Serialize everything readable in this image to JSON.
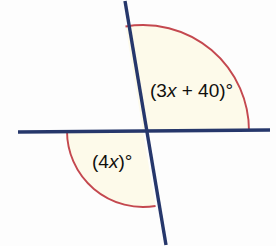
{
  "figure": {
    "kind": "geometry-diagram",
    "background_color": "#fdfdfd",
    "width": 276,
    "height": 246
  },
  "colors": {
    "line_navy": "#26376b",
    "arc_crimson": "#c4484f",
    "sector_fill": "#fdfaea",
    "text": "#100f0d"
  },
  "lines": [
    {
      "name": "horizontal-line",
      "x1": 18,
      "y1": 132,
      "x2": 270,
      "y2": 130,
      "stroke_width": 3.4
    },
    {
      "name": "transversal-line",
      "x1": 125,
      "y1": 1,
      "x2": 166,
      "y2": 245,
      "stroke_width": 3.4
    }
  ],
  "intersection": {
    "x": 143,
    "y": 131
  },
  "angles": [
    {
      "id": "upper-right-angle",
      "label_text": "(3x + 40)°",
      "label_prefix": "(3",
      "label_variable": "x",
      "label_suffix": " + 40)°",
      "label_x": 150,
      "label_y": 92,
      "arc_radius": 106,
      "start_angle_deg": 99.5,
      "end_angle_deg": 0,
      "sector_fill": "#fdfaea",
      "arc_stroke": "#c4484f"
    },
    {
      "id": "lower-left-angle",
      "label_text": "(4x)°",
      "label_prefix": "(4",
      "label_variable": "x",
      "label_suffix": ")°",
      "label_x": 92,
      "label_y": 163,
      "arc_radius": 76,
      "start_angle_deg": 180,
      "end_angle_deg": 279.5,
      "sector_fill": "#fdfaea",
      "arc_stroke": "#c4484f"
    }
  ]
}
